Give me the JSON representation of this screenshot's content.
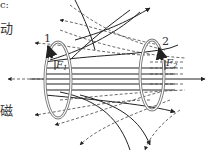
{
  "side_text": [
    {
      "text": "c:",
      "top": 0
    },
    {
      "text": "动",
      "top": 22
    },
    {
      "text": "磁",
      "top": 104
    }
  ],
  "loops": [
    {
      "label": "1",
      "force_label": "F",
      "force_sub": "1"
    },
    {
      "label": "2",
      "force_label": "F",
      "force_sub": "2"
    }
  ],
  "colors": {
    "line": "#222222",
    "dashed": "#444444",
    "loop": "#777777"
  }
}
